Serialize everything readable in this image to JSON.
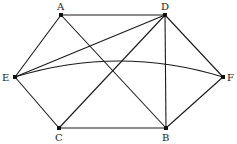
{
  "diagram": {
    "type": "graph",
    "vertices": [
      {
        "id": "A",
        "label": "A",
        "x": 61,
        "y": 15,
        "lx": 57,
        "ly": 10
      },
      {
        "id": "D",
        "label": "D",
        "x": 165,
        "y": 15,
        "lx": 161,
        "ly": 10
      },
      {
        "id": "E",
        "label": "E",
        "x": 15,
        "y": 77,
        "lx": 2,
        "ly": 81
      },
      {
        "id": "F",
        "label": "F",
        "x": 223,
        "y": 77,
        "lx": 227,
        "ly": 81
      },
      {
        "id": "C",
        "label": "C",
        "x": 59,
        "y": 128,
        "lx": 55,
        "ly": 141
      },
      {
        "id": "B",
        "label": "B",
        "x": 166,
        "y": 128,
        "lx": 162,
        "ly": 141
      }
    ],
    "edges": [
      {
        "from": "A",
        "to": "D",
        "shape": "line"
      },
      {
        "from": "A",
        "to": "E",
        "shape": "line"
      },
      {
        "from": "A",
        "to": "B",
        "shape": "line"
      },
      {
        "from": "D",
        "to": "E",
        "shape": "line"
      },
      {
        "from": "D",
        "to": "C",
        "shape": "line"
      },
      {
        "from": "D",
        "to": "B",
        "shape": "line"
      },
      {
        "from": "D",
        "to": "F",
        "shape": "line"
      },
      {
        "from": "E",
        "to": "C",
        "shape": "line"
      },
      {
        "from": "E",
        "to": "F",
        "shape": "curve"
      },
      {
        "from": "C",
        "to": "B",
        "shape": "line"
      },
      {
        "from": "B",
        "to": "F",
        "shape": "line"
      }
    ]
  }
}
